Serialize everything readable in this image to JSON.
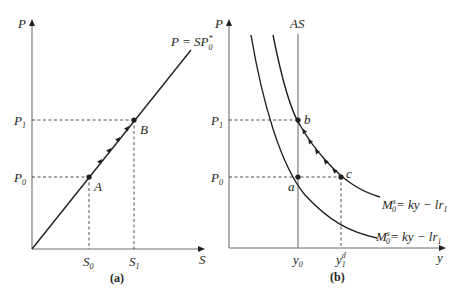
{
  "panel_a": {
    "caption": "(a)",
    "y_axis_label": "P",
    "x_axis_label": "S",
    "curve_label": "P = SP",
    "curve_label_sup": "*",
    "curve_label_sub": "0",
    "y_ticks": [
      {
        "main": "P",
        "sub": "1"
      },
      {
        "main": "P",
        "sub": "0"
      }
    ],
    "x_ticks": [
      {
        "main": "S",
        "sub": "0"
      },
      {
        "main": "S",
        "sub": "1"
      }
    ],
    "points": [
      {
        "label": "A"
      },
      {
        "label": "B"
      }
    ]
  },
  "panel_b": {
    "caption": "(b)",
    "y_axis_label": "P",
    "x_axis_label": "y",
    "vertical_line_label": "AS",
    "y_ticks": [
      {
        "main": "P",
        "sub": "1"
      },
      {
        "main": "P",
        "sub": "0"
      }
    ],
    "x_ticks": [
      {
        "main": "y",
        "sub": "0"
      },
      {
        "main": "y",
        "sub": "1",
        "sup": "d"
      }
    ],
    "points": [
      {
        "label": "a"
      },
      {
        "label": "b"
      },
      {
        "label": "c"
      }
    ],
    "curves": [
      {
        "lhs_main": "M",
        "lhs_sub": "0",
        "lhs_sup": "s",
        "rhs": "= ky − lr",
        "rhs_sub": "1"
      },
      {
        "lhs_main": "M",
        "lhs_sub": "0",
        "lhs_sup": "s",
        "rhs": "= ky − lr",
        "rhs_sub": "1"
      }
    ]
  },
  "colors": {
    "ink": "#231f20",
    "axis": "#6d6e70",
    "background": "#ffffff"
  }
}
